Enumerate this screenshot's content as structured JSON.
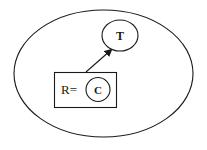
{
  "diagram": {
    "outer_region": {
      "shape": "ellipse",
      "label": ""
    },
    "nodes": [
      {
        "id": "T",
        "label": "T",
        "shape": "circle"
      },
      {
        "id": "C",
        "label": "C",
        "shape": "circle"
      }
    ],
    "box": {
      "prefix_label": "R=",
      "contains": "C"
    },
    "edges": [
      {
        "from": "R",
        "to": "T",
        "type": "arrow"
      }
    ],
    "colors": {
      "stroke": "#1a1a1a",
      "background": "#ffffff"
    }
  }
}
